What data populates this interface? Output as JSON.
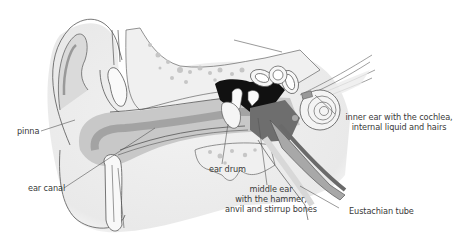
{
  "diagram": {
    "colors": {
      "background": "#ffffff",
      "outline": "#555555",
      "skin_light": "#eeeeee",
      "canal_mid": "#c4c4c4",
      "canal_dark": "#9a9a9a",
      "middle_ear_dark": "#6e6e6e",
      "cavity_black": "#111111",
      "bone_speckle": "#bdbdbd",
      "label_text": "#3a3a3a"
    },
    "labels": {
      "pinna": "pinna",
      "ear_canal": "ear canal",
      "ear_drum": "ear drum",
      "middle_ear_line1": "middle ear",
      "middle_ear_line2": "with the hammer,",
      "middle_ear_line3": "anvil and stirrup bones",
      "inner_ear_line1": "inner ear with the cochlea,",
      "inner_ear_line2": "internal liquid and hairs",
      "eustachian_tube": "Eustachian tube"
    }
  }
}
